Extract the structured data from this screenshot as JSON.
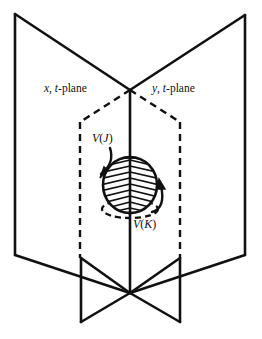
{
  "figure": {
    "background_color": "#ffffff",
    "ink_color": "#111111",
    "labels": {
      "left_plane": {
        "var": "x",
        "sep": ", ",
        "axis": "t",
        "suffix": "-plane",
        "full": "x, t-plane"
      },
      "right_plane": {
        "var": "y",
        "sep": ", ",
        "axis": "t",
        "suffix": "-plane",
        "full": "y, t-plane"
      },
      "v_j": {
        "symbol": "V",
        "open": "(",
        "arg": "J",
        "close": ")",
        "full": "V(J)"
      },
      "v_k": {
        "symbol": "V",
        "open": "(",
        "arg": "K",
        "close": ")",
        "full": "V(K)"
      }
    },
    "geometry": {
      "left_plane_points": "15,14 130,90 130,293 15,255",
      "right_plane_points": "245,15 130,90 130,293 245,255",
      "left_lower_wing_points": "81,258 130,293 81,322",
      "right_lower_wing_points": "180,258 130,293 180,322",
      "center_axis": {
        "x": 130,
        "y_top": 90,
        "y_bottom": 293
      },
      "dashed_box_points": "130,90 80,122 80,258 130,293 180,258 180,122 130,90",
      "ball": {
        "cx": 130,
        "cy": 185,
        "rx": 27,
        "ry": 28
      },
      "ball_shadow_ellipse": {
        "cx": 130,
        "cy": 210,
        "rx": 28,
        "ry": 9
      },
      "arrow_vj": {
        "from": "103,150",
        "to": "99,178"
      },
      "arrow_vk": {
        "from": "167,208",
        "to": "159,182"
      }
    }
  }
}
